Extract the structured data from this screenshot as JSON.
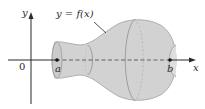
{
  "diagram": {
    "type": "solid-of-revolution",
    "curve_label": "y = f(x)",
    "axes": {
      "x_label": "x",
      "y_label": "y",
      "origin_label": "0"
    },
    "points": [
      {
        "label": "a",
        "x": 57,
        "y": 60
      },
      {
        "label": "b",
        "x": 170,
        "y": 60
      }
    ],
    "colors": {
      "solid_fill": "#d2d2d2",
      "solid_edge": "#9a9a9a",
      "cross_section": "#8f8f8f",
      "axis": "#2a2a2a",
      "text": "#2a2a2a"
    }
  }
}
